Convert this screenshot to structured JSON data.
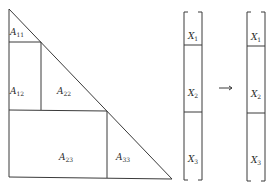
{
  "colors": {
    "line": "#3a3a3a",
    "text": "#2a2a2a",
    "background": "#ffffff"
  },
  "matrix": {
    "blocks": [
      {
        "id": "A11",
        "base": "A",
        "sub": "11",
        "x": 17,
        "y": 33
      },
      {
        "id": "A12",
        "base": "A",
        "sub": "12",
        "x": 17,
        "y": 92
      },
      {
        "id": "A22",
        "base": "A",
        "sub": "22",
        "x": 64,
        "y": 92
      },
      {
        "id": "A23",
        "base": "A",
        "sub": "23",
        "x": 66,
        "y": 158
      },
      {
        "id": "A33",
        "base": "A",
        "sub": "33",
        "x": 123,
        "y": 158
      }
    ]
  },
  "vector_left": {
    "entries": [
      {
        "id": "X1",
        "base": "X",
        "sub": "1",
        "x": 193,
        "y": 37
      },
      {
        "id": "X2",
        "base": "X",
        "sub": "2",
        "x": 193,
        "y": 94
      },
      {
        "id": "X3",
        "base": "X",
        "sub": "3",
        "x": 193,
        "y": 160
      }
    ]
  },
  "vector_right": {
    "entries": [
      {
        "id": "X1",
        "base": "X",
        "sub": "1",
        "x": 256,
        "y": 38
      },
      {
        "id": "X2",
        "base": "X",
        "sub": "2",
        "x": 256,
        "y": 95
      },
      {
        "id": "X3",
        "base": "X",
        "sub": "3",
        "x": 256,
        "y": 161
      }
    ]
  },
  "arrow": {
    "symbol": "→"
  }
}
